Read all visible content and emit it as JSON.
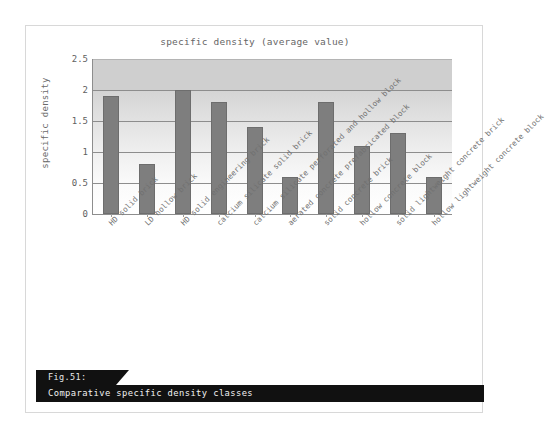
{
  "figure": {
    "caption_number": "Fig.51:",
    "caption_text": "Comparative specific density classes"
  },
  "chart_data": {
    "type": "bar",
    "title": "specific density (average value)",
    "xlabel": "",
    "ylabel": "specific density",
    "ylim": [
      0,
      2.5
    ],
    "ytick_labels": [
      "0",
      "0.5",
      "1",
      "1.5",
      "2",
      "2.5"
    ],
    "ytick_values": [
      0,
      0.5,
      1,
      1.5,
      2,
      2.5
    ],
    "grid": true,
    "legend": "none",
    "categories": [
      "HD solid brick",
      "LD hollow brick",
      "HD solid engineering brick",
      "calcium silicate solid brick",
      "calcium silicate perforated and hollow block",
      "aerated concrete prefabricated block",
      "solid concrete brick",
      "hollow concrete block",
      "solid lightweight concrete brick",
      "hollow lightweight concrete block"
    ],
    "values": [
      1.9,
      0.8,
      2.0,
      1.8,
      1.4,
      0.6,
      1.8,
      1.1,
      1.3,
      0.6
    ],
    "colors": {
      "bar": "#7e7e7e",
      "bar_edge": "#6d6d6d",
      "gridline": "#8d8d8d",
      "axis": "#8d8d8d",
      "plot_bg_top": "#cfcfcf",
      "plot_bg_bottom": "#ffffff",
      "text": "#666666",
      "caption_bg": "#111111",
      "caption_text": "#f2f2f2"
    }
  }
}
